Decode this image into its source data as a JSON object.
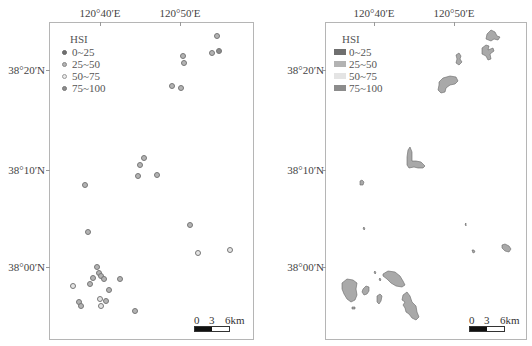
{
  "maps": {
    "left": {
      "type": "survey-stations",
      "lon_labels": [
        "120°40′E",
        "120°50′E"
      ],
      "lat_labels": [
        "38°20′N",
        "38°10′N",
        "38°00′N"
      ],
      "legend": {
        "title": "HSI",
        "items": [
          {
            "label": "0~25",
            "color": "#6f6f6f"
          },
          {
            "label": "25~50",
            "color": "#b3b3b3"
          },
          {
            "label": "50~75",
            "color": "#e4e4e4"
          },
          {
            "label": "75~100",
            "color": "#8c8c8c"
          }
        ]
      },
      "scale": {
        "labels": [
          "0",
          "3",
          "6km"
        ]
      },
      "points": [
        {
          "x": 217,
          "y": 36,
          "cls": 1
        },
        {
          "x": 212,
          "y": 53,
          "cls": 1
        },
        {
          "x": 219,
          "y": 51,
          "cls": 3
        },
        {
          "x": 183,
          "y": 56,
          "cls": 1
        },
        {
          "x": 184,
          "y": 63,
          "cls": 1
        },
        {
          "x": 172,
          "y": 86,
          "cls": 1
        },
        {
          "x": 181,
          "y": 88,
          "cls": 1
        },
        {
          "x": 144,
          "y": 158,
          "cls": 1
        },
        {
          "x": 140,
          "y": 165,
          "cls": 1
        },
        {
          "x": 138,
          "y": 176,
          "cls": 1
        },
        {
          "x": 157,
          "y": 175,
          "cls": 1
        },
        {
          "x": 85,
          "y": 185,
          "cls": 1
        },
        {
          "x": 190,
          "y": 225,
          "cls": 1
        },
        {
          "x": 88,
          "y": 232,
          "cls": 1
        },
        {
          "x": 198,
          "y": 253,
          "cls": 2
        },
        {
          "x": 230,
          "y": 250,
          "cls": 2
        },
        {
          "x": 97,
          "y": 267,
          "cls": 1
        },
        {
          "x": 99,
          "y": 273,
          "cls": 1
        },
        {
          "x": 101,
          "y": 276,
          "cls": 1
        },
        {
          "x": 93,
          "y": 278,
          "cls": 1
        },
        {
          "x": 104,
          "y": 279,
          "cls": 1
        },
        {
          "x": 120,
          "y": 279,
          "cls": 1
        },
        {
          "x": 73,
          "y": 286,
          "cls": 2
        },
        {
          "x": 90,
          "y": 284,
          "cls": 1
        },
        {
          "x": 109,
          "y": 290,
          "cls": 1
        },
        {
          "x": 79,
          "y": 302,
          "cls": 1
        },
        {
          "x": 81,
          "y": 306,
          "cls": 1
        },
        {
          "x": 100,
          "y": 299,
          "cls": 2
        },
        {
          "x": 106,
          "y": 301,
          "cls": 1
        },
        {
          "x": 101,
          "y": 306,
          "cls": 2
        },
        {
          "x": 135,
          "y": 311,
          "cls": 1
        }
      ]
    },
    "right": {
      "type": "habitat-polygons",
      "lon_labels": [
        "120°40′E",
        "120°50′E"
      ],
      "lat_labels": [
        "38°20′N",
        "38°10′N",
        "38°00′N"
      ],
      "legend": {
        "title": "HSI",
        "items": [
          {
            "label": "0~25",
            "color": "#6f6f6f"
          },
          {
            "label": "25~50",
            "color": "#b3b3b3"
          },
          {
            "label": "50~75",
            "color": "#e4e4e4"
          },
          {
            "label": "75~100",
            "color": "#8c8c8c"
          }
        ]
      },
      "scale": {
        "labels": [
          "0",
          "3",
          "6km"
        ]
      }
    }
  }
}
